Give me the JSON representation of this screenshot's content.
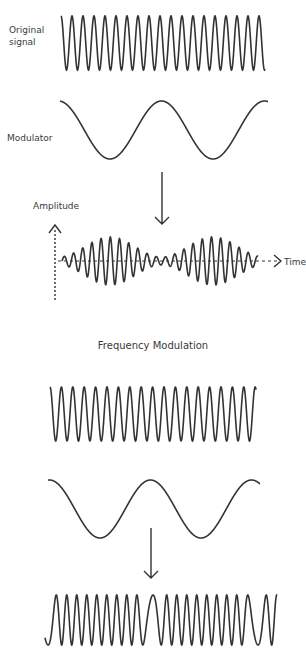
{
  "labels": {
    "original_signal_line1": "Original",
    "original_signal_line2": "signal",
    "modulator": "Modulator",
    "amplitude": "Amplitude",
    "time": "Time",
    "fm_title": "Frequency Modulation"
  },
  "style": {
    "stroke_color": "#333333",
    "text_color": "#3a3a3a",
    "background": "#ffffff"
  }
}
